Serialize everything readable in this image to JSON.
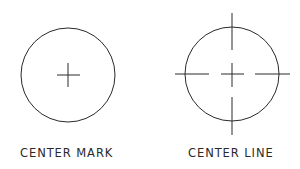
{
  "figures": [
    {
      "id": "center-mark",
      "label": "CENTER MARK",
      "circle": {
        "cx": 68,
        "cy": 75,
        "r": 47
      },
      "mark": {
        "h": [
          57,
          80
        ],
        "v": [
          63,
          87
        ]
      }
    },
    {
      "id": "center-line",
      "label": "CENTER LINE",
      "circle": {
        "cx": 232,
        "cy": 74,
        "r": 47
      },
      "h_segments": [
        [
          175,
          209
        ],
        [
          221,
          244
        ],
        [
          255,
          290
        ]
      ],
      "v_segments": [
        [
          13,
          50
        ],
        [
          63,
          87
        ],
        [
          97,
          135
        ]
      ]
    }
  ],
  "colors": {
    "stroke": "#2a2a2a",
    "background": "#ffffff"
  }
}
